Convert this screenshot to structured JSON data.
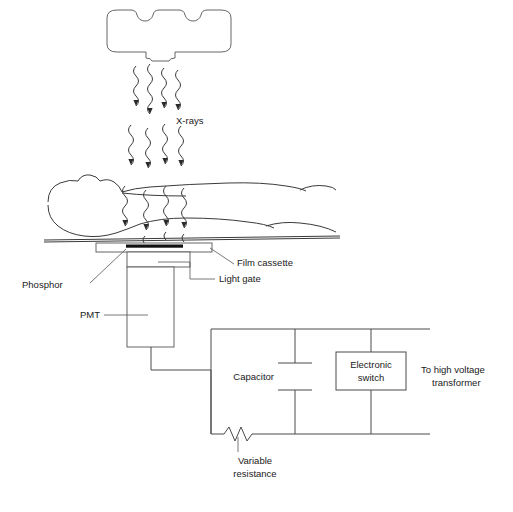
{
  "diagram": {
    "background_color": "#ffffff",
    "line_color": "#4a4a4a",
    "text_color": "#1a1a1a"
  },
  "labels": {
    "xrays": "X-rays",
    "film_cassette": "Film cassette",
    "light_gate": "Light gate",
    "phosphor": "Phosphor",
    "pmt": "PMT",
    "capacitor": "Capacitor",
    "electronic_switch_line1": "Electronic",
    "electronic_switch_line2": "switch",
    "transformer_line1": "To high voltage",
    "transformer_line2": "transformer",
    "variable_resistance_line1": "Variable",
    "variable_resistance_line2": "resistance"
  },
  "components": {
    "xray_tube_housing": "x-ray tube housing",
    "patient": "patient on table",
    "table": "table top",
    "cassette": "film cassette",
    "phosphor_strip": "phosphor strip",
    "pmt_body": "photomultiplier tube",
    "light_gate_box": "light gate",
    "capacitor_symbol": "capacitor",
    "switch_box": "electronic switch",
    "resistor_symbol": "variable resistor"
  },
  "beam": {
    "label": "X-rays",
    "ray_count": 4,
    "description": "wavy arrows directed downward from tube through patient to cassette"
  }
}
